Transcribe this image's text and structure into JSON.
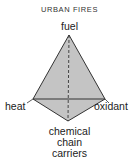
{
  "title": "URBAN FIRES",
  "diagram": {
    "type": "fire tetrahedron",
    "vertices": {
      "top": "fuel",
      "left": "heat",
      "right": "oxidant",
      "bottom": [
        "chemical",
        "chain",
        "carriers"
      ]
    }
  },
  "colors": {
    "face_fill": "#c4c4c4",
    "edge": "#333333"
  }
}
